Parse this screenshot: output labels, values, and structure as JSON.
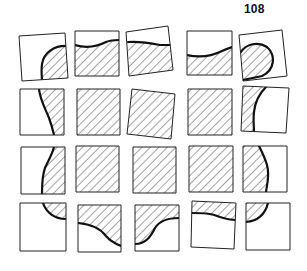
{
  "page": {
    "number": "108"
  },
  "figure": {
    "colors": {
      "outline": "#222222",
      "hatch": "#333333",
      "curve": "#111111",
      "fill": "#ffffff"
    },
    "tiles": [
      {
        "id": "r1c1",
        "corners": [
          [
            19,
            36
          ],
          [
            65,
            33
          ],
          [
            68,
            78
          ],
          [
            22,
            81
          ]
        ],
        "hatch": "M68 46 C55 45 44 52 42 64 C41 72 42 77 42 80 L68 78 Z",
        "curve": "M68 46 C55 45 44 52 42 64 C41 72 42 77 42 80"
      },
      {
        "id": "r1c2",
        "corners": [
          [
            75,
            31
          ],
          [
            119,
            31
          ],
          [
            119,
            76
          ],
          [
            75,
            76
          ]
        ],
        "hatch": "M75 45 C88 49 98 46 106 42 C111 40 115 40 119 40 L119 76 L75 76 Z",
        "curve": "M75 45 C88 49 98 46 106 42 C111 40 115 40 119 40"
      },
      {
        "id": "r1c3",
        "corners": [
          [
            126,
            32
          ],
          [
            168,
            26
          ],
          [
            173,
            70
          ],
          [
            129,
            76
          ]
        ],
        "hatch": "M128 42 C140 41 150 43 160 45 L171 45 L173 70 L129 76 Z",
        "curve": "M128 42 C140 41 150 43 160 45 L171 45"
      },
      {
        "id": "r1c4",
        "corners": [
          [
            187,
            31
          ],
          [
            232,
            31
          ],
          [
            232,
            75
          ],
          [
            187,
            75
          ]
        ],
        "hatch": "M187 55 C200 58 212 56 222 51 C226 49 229 48 232 47 L232 75 L187 75 Z",
        "curve": "M187 55 C200 58 212 56 222 51 C226 49 229 48 232 47"
      },
      {
        "id": "r1c5",
        "corners": [
          [
            239,
            35
          ],
          [
            282,
            30
          ],
          [
            287,
            76
          ],
          [
            243,
            81
          ]
        ],
        "hatch": "M241 52 C246 44 258 41 267 47 C276 55 275 70 262 76 L243 80 Z",
        "curve": "M241 52 C246 44 258 41 267 47 C276 55 275 70 262 76 L243 80"
      },
      {
        "id": "r2c1",
        "corners": [
          [
            20,
            89
          ],
          [
            64,
            89
          ],
          [
            64,
            135
          ],
          [
            20,
            135
          ]
        ],
        "hatch": "M39 89 C40 100 46 110 49 118 C52 126 53 131 54 135 L64 135 L64 89 Z",
        "curve": "M39 89 C40 100 46 110 49 118 C52 126 53 131 54 135"
      },
      {
        "id": "r2c2",
        "corners": [
          [
            77,
            89
          ],
          [
            120,
            89
          ],
          [
            120,
            135
          ],
          [
            77,
            135
          ]
        ],
        "hatch": "M77 89 L120 89 L120 135 L77 135 Z",
        "curve": ""
      },
      {
        "id": "r2c3",
        "corners": [
          [
            132,
            89
          ],
          [
            175,
            94
          ],
          [
            171,
            139
          ],
          [
            127,
            134
          ]
        ],
        "hatch": "M132 89 L175 94 L171 139 L127 134 Z",
        "curve": ""
      },
      {
        "id": "r2c4",
        "corners": [
          [
            188,
            89
          ],
          [
            232,
            89
          ],
          [
            232,
            135
          ],
          [
            188,
            135
          ]
        ],
        "hatch": "M188 89 L232 89 L232 135 L188 135 Z",
        "curve": ""
      },
      {
        "id": "r2c5",
        "corners": [
          [
            243,
            86
          ],
          [
            289,
            88
          ],
          [
            286,
            133
          ],
          [
            241,
            131
          ]
        ],
        "hatch": "M243 86 L266 87 C259 94 255 102 254 112 C253 120 254 127 254 132 L241 131 Z",
        "curve": "M266 87 C259 94 255 102 254 112 C253 120 254 127 254 132"
      },
      {
        "id": "r3c1",
        "corners": [
          [
            21,
            147
          ],
          [
            65,
            147
          ],
          [
            65,
            194
          ],
          [
            21,
            194
          ]
        ],
        "hatch": "M54 147 C52 155 48 161 45 168 C42 176 42 186 42 194 L65 194 L65 147 Z",
        "curve": "M54 147 C52 155 48 161 45 168 C42 176 42 186 42 194"
      },
      {
        "id": "r3c2",
        "corners": [
          [
            76,
            146
          ],
          [
            119,
            146
          ],
          [
            119,
            192
          ],
          [
            76,
            192
          ]
        ],
        "hatch": "M76 146 L119 146 L119 192 L76 192 Z",
        "curve": ""
      },
      {
        "id": "r3c3",
        "corners": [
          [
            133,
            147
          ],
          [
            176,
            147
          ],
          [
            176,
            193
          ],
          [
            133,
            193
          ]
        ],
        "hatch": "M133 147 L176 147 L176 193 L133 193 Z",
        "curve": ""
      },
      {
        "id": "r3c4",
        "corners": [
          [
            189,
            146
          ],
          [
            233,
            146
          ],
          [
            233,
            192
          ],
          [
            189,
            192
          ]
        ],
        "hatch": "M189 146 L233 146 L233 192 L189 192 Z",
        "curve": ""
      },
      {
        "id": "r3c5",
        "corners": [
          [
            243,
            146
          ],
          [
            287,
            146
          ],
          [
            287,
            192
          ],
          [
            243,
            192
          ]
        ],
        "hatch": "M243 146 L259 146 C262 152 265 158 267 165 C270 175 267 184 266 192 L243 192 Z",
        "curve": "M259 146 C262 152 265 158 267 165 C270 175 267 184 266 192"
      },
      {
        "id": "r4c1",
        "corners": [
          [
            20,
            203
          ],
          [
            66,
            203
          ],
          [
            66,
            251
          ],
          [
            20,
            251
          ]
        ],
        "hatch": "M43 203 C46 212 54 219 66 219 L66 203 Z",
        "curve": "M43 203 C46 212 54 219 66 219"
      },
      {
        "id": "r4c2",
        "corners": [
          [
            78,
            205
          ],
          [
            121,
            205
          ],
          [
            121,
            252
          ],
          [
            78,
            252
          ]
        ],
        "hatch": "M78 223 C90 224 100 228 106 236 C111 242 116 244 121 246 L121 205 L78 205 Z",
        "curve": "M78 223 C90 224 100 228 106 236 C111 242 116 244 121 246"
      },
      {
        "id": "r4c3",
        "corners": [
          [
            135,
            205
          ],
          [
            179,
            205
          ],
          [
            179,
            251
          ],
          [
            135,
            251
          ]
        ],
        "hatch": "M135 244 C146 244 151 236 155 228 C160 220 168 218 179 218 L179 205 L135 205 Z",
        "curve": "M135 244 C146 244 151 236 155 228 C160 220 168 218 179 218"
      },
      {
        "id": "r4c4",
        "corners": [
          [
            192,
            201
          ],
          [
            236,
            203
          ],
          [
            234,
            249
          ],
          [
            191,
            247
          ]
        ],
        "hatch": "M192 213 C202 213 211 213 220 217 C226 219 231 220 236 220 L236 203 L192 201 Z",
        "curve": "M192 213 C202 213 211 213 220 217 C226 219 231 220 236 220"
      },
      {
        "id": "r4c5",
        "corners": [
          [
            246,
            203
          ],
          [
            290,
            203
          ],
          [
            290,
            250
          ],
          [
            246,
            250
          ]
        ],
        "hatch": "M246 222 C257 221 265 215 268 203 L246 203 Z",
        "curve": "M246 222 C257 221 265 215 268 203"
      }
    ]
  }
}
